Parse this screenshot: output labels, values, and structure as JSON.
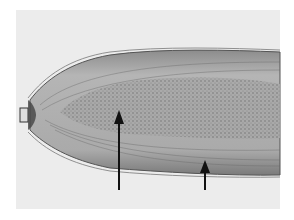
{
  "figure": {
    "background_color": "#ececec",
    "specimen_color": "#9a9a9a",
    "arrows": [
      {
        "name": "arrow-left",
        "x": 119,
        "y_tail": 190,
        "y_head": 110
      },
      {
        "name": "arrow-right",
        "x": 205,
        "y_tail": 190,
        "y_head": 160
      }
    ]
  }
}
